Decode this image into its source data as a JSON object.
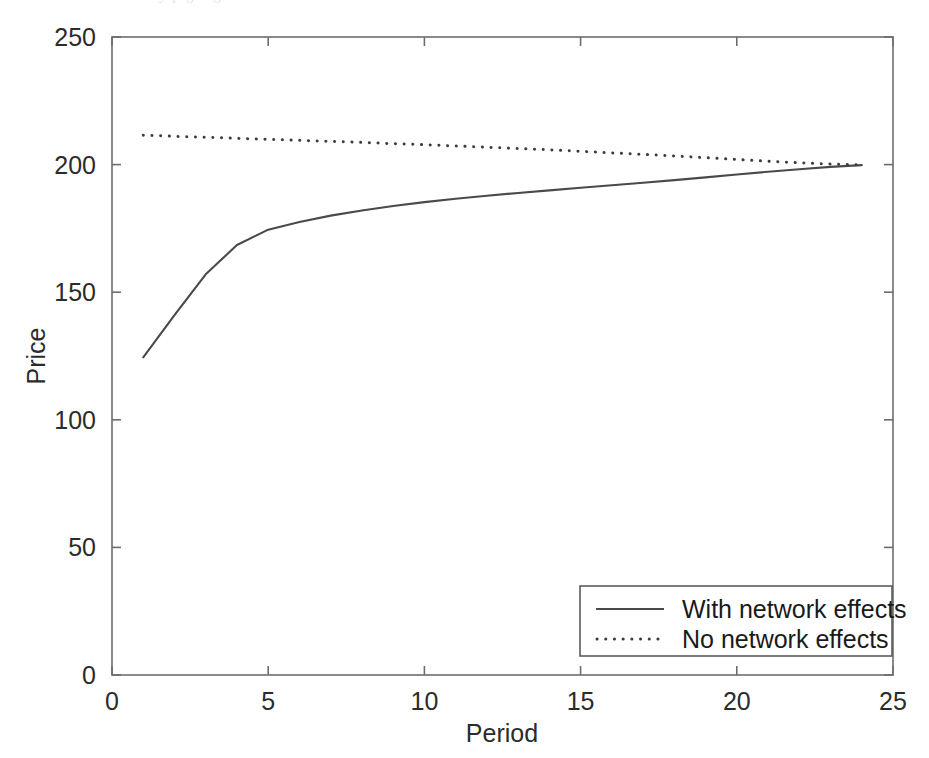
{
  "figure": {
    "background_color": "#ffffff",
    "line_color": "#4a4a4a",
    "axis_color": "#6d6d6d",
    "scan_artifact_text": "by p g   o g"
  },
  "chart_data": {
    "type": "line",
    "title": "",
    "xlabel": "Period",
    "ylabel": "Price",
    "xlim": [
      0,
      25
    ],
    "ylim": [
      0,
      250
    ],
    "xticks": [
      0,
      5,
      10,
      15,
      20,
      25
    ],
    "yticks": [
      0,
      50,
      100,
      150,
      200,
      250
    ],
    "xtick_labels": [
      "0",
      "5",
      "10",
      "15",
      "20",
      "25"
    ],
    "ytick_labels": [
      "0",
      "50",
      "100",
      "150",
      "200",
      "250"
    ],
    "grid": false,
    "legend_position": "lower right",
    "x": [
      1,
      2,
      3,
      4,
      5,
      6,
      7,
      8,
      9,
      10,
      11,
      12,
      13,
      14,
      15,
      16,
      17,
      18,
      19,
      20,
      21,
      22,
      23,
      24
    ],
    "series": [
      {
        "name": "With network effects",
        "style": "solid",
        "values": [
          124.5,
          141.0,
          157.0,
          168.5,
          174.5,
          177.5,
          180.0,
          182.0,
          183.8,
          185.3,
          186.6,
          187.8,
          188.9,
          189.9,
          190.9,
          191.9,
          192.9,
          193.9,
          195.0,
          196.1,
          197.2,
          198.2,
          199.1,
          199.8
        ]
      },
      {
        "name": "No network effects",
        "style": "dotted",
        "values": [
          211.5,
          211.1,
          210.7,
          210.3,
          209.9,
          209.5,
          209.1,
          208.7,
          208.2,
          207.8,
          207.3,
          206.8,
          206.3,
          205.8,
          205.2,
          204.6,
          204.0,
          203.4,
          202.7,
          202.0,
          201.3,
          200.7,
          200.2,
          199.9
        ]
      }
    ],
    "legend": [
      {
        "label": "With network effects",
        "style": "solid"
      },
      {
        "label": "No network effects",
        "style": "dotted"
      }
    ]
  }
}
